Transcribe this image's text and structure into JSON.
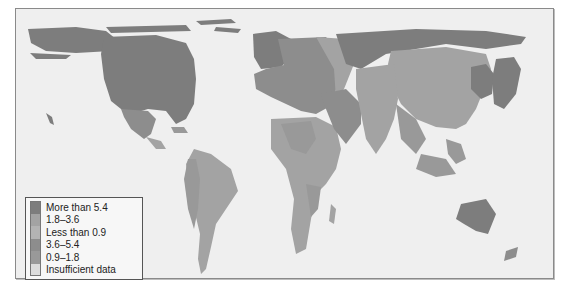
{
  "map": {
    "type": "cartogram",
    "colors": {
      "ocean": "#efefef",
      "more_than_5_4": "#7d7d7d",
      "3_6_to_5_4": "#8d8d8d",
      "1_8_to_3_6": "#a3a3a3",
      "0_9_to_1_8": "#999999",
      "less_than_0_9": "#b3b3b3",
      "insufficient": "#dcdcdc"
    }
  },
  "legend": {
    "items": [
      {
        "label": "More than 5.4",
        "color": "#7d7d7d"
      },
      {
        "label": "1.8–3.6",
        "color": "#a3a3a3"
      },
      {
        "label": "Less than 0.9",
        "color": "#b3b3b3"
      },
      {
        "label": "3.6–5.4",
        "color": "#8d8d8d"
      },
      {
        "label": "0.9–1.8",
        "color": "#999999"
      },
      {
        "label": "Insufficient data",
        "color": "#dcdcdc"
      }
    ]
  }
}
